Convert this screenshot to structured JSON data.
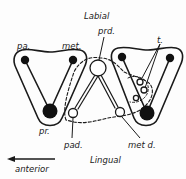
{
  "figure": {
    "type": "tooth cusp pattern diagram",
    "orientation_labels": {
      "top": "Labial",
      "bottom": "Lingual",
      "direction_arrow": "anterior"
    },
    "cusp_labels": {
      "paracone": "pa.",
      "metacone": "met.",
      "protocone": "pr.",
      "protoconid": "prd.",
      "paraconid": "pad.",
      "metaconid": "met d.",
      "talonid": "t."
    },
    "colors": {
      "ink": "#1a1a1a",
      "background": "#fdfdfd"
    }
  }
}
